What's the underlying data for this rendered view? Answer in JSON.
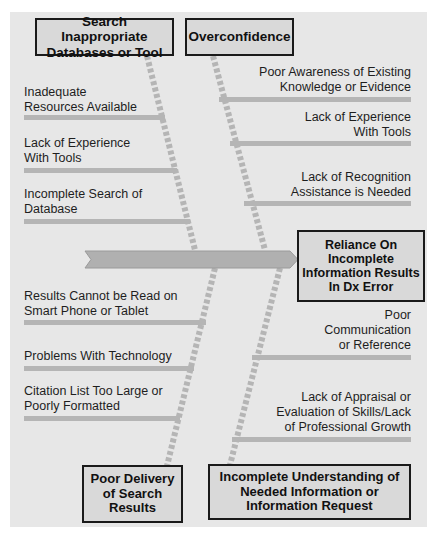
{
  "diagram": {
    "type": "fishbone",
    "effect": "Reliance On Incomplete Information Results In Dx Error",
    "colors": {
      "panel": "#e7e7e7",
      "box_fill": "#d9d9d9",
      "box_border": "#1a1a1a",
      "bone": "#b5b5b5",
      "spine": "#b0b0b0"
    },
    "categories": [
      {
        "label": "Search Inappropriate Databases or Tool",
        "position": "top-left",
        "causes": [
          "Inadequate Resources Available",
          "Lack of Experience With Tools",
          "Incomplete Search of Database"
        ]
      },
      {
        "label": "Overconfidence",
        "position": "top-right",
        "causes": [
          "Poor Awareness of Existing Knowledge or Evidence",
          "Lack of Experience With Tools",
          "Lack of Recognition Assistance is Needed"
        ]
      },
      {
        "label": "Poor Delivery of Search Results",
        "position": "bottom-left",
        "causes": [
          "Results Cannot be Read on Smart Phone or Tablet",
          "Problems With Technology",
          "Citation List Too Large or Poorly Formatted"
        ]
      },
      {
        "label": "Incomplete Understanding of Needed Information or Information Request",
        "position": "bottom-right",
        "causes": [
          "Poor Communication or Reference",
          "Lack of Appraisal or Evaluation of Skills/Lack of Professional Growth"
        ]
      }
    ]
  },
  "boxes": {
    "search": [
      "Search Inappropriate",
      "Databases or Tool"
    ],
    "overconfidence": [
      "Overconfidence"
    ],
    "effect": [
      "Reliance On",
      "Incomplete",
      "Information Results",
      "In Dx Error"
    ],
    "delivery": [
      "Poor Delivery",
      "of Search",
      "Results"
    ],
    "understanding": [
      "Incomplete Understanding of",
      "Needed Information or",
      "Information Request"
    ]
  },
  "causes": {
    "tl1": [
      "Inadequate",
      "Resources Available"
    ],
    "tl2": [
      "Lack of Experience",
      "With Tools"
    ],
    "tl3": [
      "Incomplete Search of",
      "Database"
    ],
    "tr1": [
      "Poor Awareness of Existing",
      "Knowledge or Evidence"
    ],
    "tr2": [
      "Lack of Experience",
      "With Tools"
    ],
    "tr3": [
      "Lack of Recognition",
      "Assistance is Needed"
    ],
    "bl1": [
      "Results Cannot be Read on",
      "Smart Phone or Tablet"
    ],
    "bl2": [
      "Problems With Technology"
    ],
    "bl3": [
      "Citation List Too Large or",
      "Poorly Formatted"
    ],
    "br1": [
      "Poor",
      "Communication",
      "or Reference"
    ],
    "br2": [
      "Lack of Appraisal or",
      "Evaluation of Skills/Lack",
      "of Professional Growth"
    ]
  }
}
